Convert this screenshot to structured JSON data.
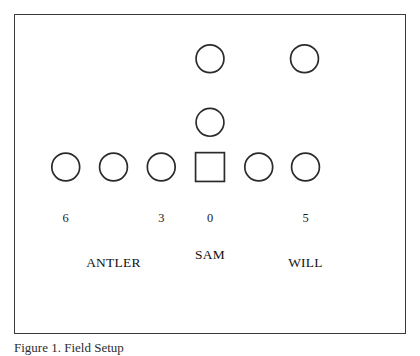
{
  "figure": {
    "caption": "Figure 1. Field Setup",
    "panel": {
      "border_color": "#3a3a3a",
      "background_color": "#ffffff"
    },
    "stroke_color": "#2b2b2b",
    "text_color": "#111111"
  },
  "diagram": {
    "type": "formation-diagram",
    "shapes": [
      {
        "id": "back-middle",
        "shape": "circle",
        "cx": 210,
        "cy": 58,
        "r": 14
      },
      {
        "id": "back-right",
        "shape": "circle",
        "cx": 305,
        "cy": 58,
        "r": 14
      },
      {
        "id": "mid-middle",
        "shape": "circle",
        "cx": 210,
        "cy": 122,
        "r": 14
      },
      {
        "id": "line-1",
        "shape": "circle",
        "cx": 65,
        "cy": 167,
        "r": 14
      },
      {
        "id": "line-2",
        "shape": "circle",
        "cx": 113,
        "cy": 167,
        "r": 14
      },
      {
        "id": "line-3",
        "shape": "circle",
        "cx": 161,
        "cy": 167,
        "r": 14
      },
      {
        "id": "line-center",
        "shape": "square",
        "cx": 210,
        "cy": 167,
        "size": 29
      },
      {
        "id": "line-5",
        "shape": "circle",
        "cx": 259,
        "cy": 167,
        "r": 14
      },
      {
        "id": "line-6",
        "shape": "circle",
        "cx": 306,
        "cy": 167,
        "r": 14
      }
    ],
    "numbers": [
      {
        "id": "number-6",
        "value": "6",
        "x": 65,
        "y": 222
      },
      {
        "id": "number-3",
        "value": "3",
        "x": 161,
        "y": 222
      },
      {
        "id": "number-0",
        "value": "0",
        "x": 210,
        "y": 222
      },
      {
        "id": "number-5",
        "value": "5",
        "x": 306,
        "y": 222
      }
    ],
    "group_labels": [
      {
        "id": "label-antler",
        "text": "ANTLER",
        "x": 113,
        "y": 268
      },
      {
        "id": "label-sam",
        "text": "SAM",
        "x": 210,
        "y": 260
      },
      {
        "id": "label-will",
        "text": "WILL",
        "x": 306,
        "y": 268
      }
    ]
  }
}
